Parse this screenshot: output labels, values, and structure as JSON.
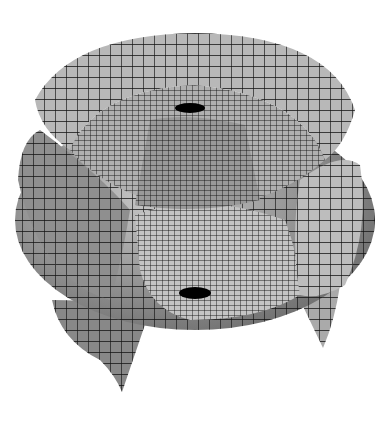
{
  "figure": {
    "colors": {
      "background": "#ffffff",
      "mesh_line": "#111111",
      "surface_light": "#c8c8c8",
      "surface_mid": "#9a9a9a",
      "surface_dark": "#555555",
      "hole": "#000000"
    }
  }
}
